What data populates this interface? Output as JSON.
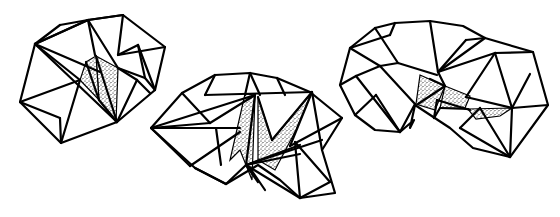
{
  "illustration": {
    "description": "Three folded polyhedral (origami-like) line-art shapes with stippled shaded facets",
    "stroke_color": "#000000",
    "background": "#ffffff",
    "shade_color": "#000000",
    "shapes": [
      {
        "name": "left-polyhedron",
        "shaded": [
          [
            [
              96,
              56
            ],
            [
              118,
              68
            ],
            [
              116,
              122
            ],
            [
              99,
              100
            ]
          ],
          [
            [
              86,
              62
            ],
            [
              96,
              56
            ],
            [
              99,
              100
            ],
            [
              80,
              80
            ]
          ]
        ],
        "edges": [
          [
            [
              35,
              44
            ],
            [
              88,
              20
            ],
            [
              123,
              15
            ],
            [
              165,
              47
            ],
            [
              155,
              90
            ],
            [
              117,
              122
            ],
            [
              61,
              143
            ],
            [
              20,
              102
            ],
            [
              35,
              44
            ]
          ],
          [
            [
              35,
              44
            ],
            [
              88,
              20
            ]
          ],
          [
            [
              88,
              20
            ],
            [
              123,
              15
            ]
          ],
          [
            [
              88,
              20
            ],
            [
              95,
              55
            ]
          ],
          [
            [
              88,
              20
            ],
            [
              118,
              68
            ]
          ],
          [
            [
              123,
              15
            ],
            [
              118,
              55
            ]
          ],
          [
            [
              118,
              55
            ],
            [
              165,
              47
            ]
          ],
          [
            [
              118,
              55
            ],
            [
              138,
              45
            ]
          ],
          [
            [
              138,
              45
            ],
            [
              155,
              90
            ]
          ],
          [
            [
              138,
              45
            ],
            [
              145,
              78
            ]
          ],
          [
            [
              145,
              78
            ],
            [
              155,
              90
            ]
          ],
          [
            [
              118,
              68
            ],
            [
              145,
              78
            ]
          ],
          [
            [
              118,
              68
            ],
            [
              137,
              80
            ]
          ],
          [
            [
              137,
              80
            ],
            [
              117,
              122
            ]
          ],
          [
            [
              137,
              80
            ],
            [
              150,
              93
            ]
          ],
          [
            [
              35,
              44
            ],
            [
              117,
              122
            ]
          ],
          [
            [
              35,
              44
            ],
            [
              80,
              80
            ]
          ],
          [
            [
              35,
              44
            ],
            [
              100,
              72
            ]
          ],
          [
            [
              20,
              102
            ],
            [
              80,
              80
            ]
          ],
          [
            [
              80,
              80
            ],
            [
              61,
              143
            ]
          ],
          [
            [
              20,
              102
            ],
            [
              60,
              118
            ]
          ],
          [
            [
              60,
              118
            ],
            [
              61,
              143
            ]
          ],
          [
            [
              96,
              56
            ],
            [
              117,
              122
            ]
          ],
          [
            [
              86,
              62
            ],
            [
              99,
              100
            ]
          ],
          [
            [
              99,
              100
            ],
            [
              117,
              122
            ]
          ],
          [
            [
              88,
              20
            ],
            [
              60,
              25
            ]
          ],
          [
            [
              60,
              25
            ],
            [
              35,
              44
            ]
          ]
        ]
      },
      {
        "name": "middle-polyhedron",
        "shaded": [
          [
            [
              245,
              94
            ],
            [
              255,
              95
            ],
            [
              252,
              180
            ],
            [
              240,
              150
            ],
            [
              230,
              160
            ]
          ],
          [
            [
              258,
              97
            ],
            [
              272,
              140
            ],
            [
              312,
              92
            ],
            [
              296,
              130
            ],
            [
              275,
              170
            ],
            [
              258,
              160
            ]
          ]
        ],
        "edges": [
          [
            [
              151,
              128
            ],
            [
              182,
              93
            ],
            [
              215,
              75
            ],
            [
              250,
              73
            ],
            [
              277,
              78
            ],
            [
              310,
              92
            ],
            [
              342,
              118
            ],
            [
              322,
              150
            ],
            [
              335,
              193
            ],
            [
              300,
              198
            ],
            [
              280,
              180
            ],
            [
              258,
              165
            ],
            [
              226,
              184
            ],
            [
              195,
              168
            ],
            [
              151,
              128
            ]
          ],
          [
            [
              182,
              93
            ],
            [
              210,
              123
            ]
          ],
          [
            [
              210,
              123
            ],
            [
              255,
              95
            ]
          ],
          [
            [
              151,
              128
            ],
            [
              255,
              95
            ]
          ],
          [
            [
              151,
              128
            ],
            [
              210,
              123
            ]
          ],
          [
            [
              151,
              128
            ],
            [
              240,
              128
            ]
          ],
          [
            [
              151,
              128
            ],
            [
              190,
              166
            ]
          ],
          [
            [
              190,
              166
            ],
            [
              240,
              132
            ]
          ],
          [
            [
              216,
              128
            ],
            [
              221,
              165
            ]
          ],
          [
            [
              250,
              73
            ],
            [
              245,
              95
            ]
          ],
          [
            [
              250,
              73
            ],
            [
              260,
              95
            ]
          ],
          [
            [
              215,
              75
            ],
            [
              205,
              95
            ]
          ],
          [
            [
              277,
              78
            ],
            [
              285,
              95
            ]
          ],
          [
            [
              205,
              95
            ],
            [
              312,
              92
            ]
          ],
          [
            [
              255,
              95
            ],
            [
              246,
              165
            ]
          ],
          [
            [
              258,
              97
            ],
            [
              272,
              140
            ]
          ],
          [
            [
              272,
              140
            ],
            [
              312,
              92
            ]
          ],
          [
            [
              312,
              92
            ],
            [
              322,
              150
            ]
          ],
          [
            [
              312,
              92
            ],
            [
              290,
              146
            ]
          ],
          [
            [
              290,
              146
            ],
            [
              342,
              118
            ]
          ],
          [
            [
              246,
              165
            ],
            [
              322,
              140
            ]
          ],
          [
            [
              246,
              165
            ],
            [
              300,
              145
            ]
          ],
          [
            [
              246,
              165
            ],
            [
              300,
              154
            ]
          ],
          [
            [
              246,
              165
            ],
            [
              300,
              198
            ]
          ],
          [
            [
              300,
              198
            ],
            [
              330,
              182
            ]
          ],
          [
            [
              295,
              142
            ],
            [
              300,
              198
            ]
          ],
          [
            [
              295,
              142
            ],
            [
              330,
              182
            ]
          ],
          [
            [
              246,
              165
            ],
            [
              258,
              182
            ]
          ],
          [
            [
              250,
              168
            ],
            [
              265,
              190
            ]
          ],
          [
            [
              195,
              168
            ],
            [
              226,
              184
            ]
          ],
          [
            [
              226,
              184
            ],
            [
              246,
              165
            ]
          ]
        ]
      },
      {
        "name": "right-polyhedron",
        "shaded": [
          [
            [
              420,
              75
            ],
            [
              445,
              86
            ],
            [
              435,
              110
            ],
            [
              416,
              104
            ]
          ],
          [
            [
              445,
              86
            ],
            [
              470,
              96
            ],
            [
              465,
              108
            ],
            [
              440,
              108
            ]
          ],
          [
            [
              468,
              109
            ],
            [
              512,
              108
            ],
            [
              500,
              116
            ],
            [
              476,
              119
            ]
          ]
        ],
        "edges": [
          [
            [
              350,
              48
            ],
            [
              375,
              28
            ],
            [
              395,
              23
            ],
            [
              430,
              21
            ],
            [
              463,
              26
            ],
            [
              485,
              38
            ],
            [
              533,
              52
            ],
            [
              548,
              105
            ],
            [
              510,
              157
            ],
            [
              473,
              148
            ],
            [
              450,
              128
            ],
            [
              415,
              105
            ],
            [
              410,
              128
            ],
            [
              414,
              120
            ],
            [
              400,
              132
            ],
            [
              375,
              130
            ],
            [
              355,
              115
            ],
            [
              340,
              85
            ],
            [
              350,
              48
            ]
          ],
          [
            [
              395,
              23
            ],
            [
              390,
              35
            ]
          ],
          [
            [
              390,
              35
            ],
            [
              350,
              48
            ]
          ],
          [
            [
              375,
              28
            ],
            [
              398,
              63
            ]
          ],
          [
            [
              398,
              63
            ],
            [
              437,
              75
            ]
          ],
          [
            [
              430,
              21
            ],
            [
              438,
              72
            ]
          ],
          [
            [
              438,
              72
            ],
            [
              466,
              40
            ]
          ],
          [
            [
              466,
              40
            ],
            [
              485,
              38
            ]
          ],
          [
            [
              485,
              38
            ],
            [
              438,
              72
            ]
          ],
          [
            [
              438,
              72
            ],
            [
              495,
              53
            ]
          ],
          [
            [
              495,
              53
            ],
            [
              533,
              52
            ]
          ],
          [
            [
              495,
              53
            ],
            [
              466,
              97
            ]
          ],
          [
            [
              466,
              97
            ],
            [
              512,
              108
            ]
          ],
          [
            [
              495,
              53
            ],
            [
              512,
              108
            ]
          ],
          [
            [
              512,
              108
            ],
            [
              548,
              105
            ]
          ],
          [
            [
              512,
              108
            ],
            [
              510,
              157
            ]
          ],
          [
            [
              512,
              108
            ],
            [
              530,
              74
            ]
          ],
          [
            [
              510,
              157
            ],
            [
              480,
              108
            ]
          ],
          [
            [
              480,
              108
            ],
            [
              460,
              128
            ]
          ],
          [
            [
              460,
              128
            ],
            [
              510,
              157
            ]
          ],
          [
            [
              350,
              48
            ],
            [
              380,
              66
            ]
          ],
          [
            [
              340,
              85
            ],
            [
              356,
              76
            ]
          ],
          [
            [
              356,
              76
            ],
            [
              380,
              66
            ]
          ],
          [
            [
              380,
              66
            ],
            [
              398,
              63
            ]
          ],
          [
            [
              356,
              76
            ],
            [
              400,
              132
            ]
          ],
          [
            [
              380,
              66
            ],
            [
              415,
              104
            ]
          ],
          [
            [
              415,
              104
            ],
            [
              400,
              132
            ]
          ],
          [
            [
              376,
              95
            ],
            [
              400,
              132
            ]
          ],
          [
            [
              376,
              95
            ],
            [
              355,
              115
            ]
          ],
          [
            [
              437,
              100
            ],
            [
              470,
              110
            ]
          ],
          [
            [
              437,
              100
            ],
            [
              434,
              118
            ]
          ],
          [
            [
              434,
              118
            ],
            [
              440,
              108
            ]
          ],
          [
            [
              418,
              104
            ],
            [
              445,
              86
            ]
          ],
          [
            [
              430,
              79
            ],
            [
              445,
              86
            ]
          ],
          [
            [
              445,
              86
            ],
            [
              438,
              72
            ]
          ],
          [
            [
              440,
              108
            ],
            [
              468,
              109
            ]
          ]
        ]
      }
    ]
  }
}
